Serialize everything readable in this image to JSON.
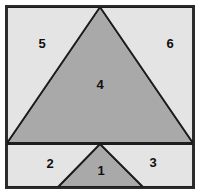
{
  "figure": {
    "type": "geometric-diagram",
    "canvas": {
      "width": 200,
      "height": 194
    },
    "colors": {
      "page_background": "#ffffff",
      "light_region_fill": "#e4e4e4",
      "dark_region_fill": "#a9a9a9",
      "outline_stroke": "#1c1c1c",
      "frame_stroke": "#2a2a2a",
      "label_text": "#101010"
    },
    "frame": {
      "x": 6,
      "y": 6,
      "width": 188,
      "height": 182,
      "stroke_width": 2
    },
    "divider": {
      "name": "horizontal-divider",
      "x1": 7,
      "y1": 143,
      "x2": 193,
      "y2": 143,
      "stroke_width": 2
    },
    "shapes": [
      {
        "id": "region-4",
        "label": "4",
        "shade": "dark",
        "points": "100,7 193,143 7,143",
        "label_x": 100,
        "label_y": 86
      },
      {
        "id": "region-5",
        "label": "5",
        "shade": "light",
        "points": "7,7 100,7 7,143",
        "label_x": 42,
        "label_y": 45
      },
      {
        "id": "region-6",
        "label": "6",
        "shade": "light",
        "points": "100,7 193,7 193,143",
        "label_x": 170,
        "label_y": 45
      },
      {
        "id": "region-1",
        "label": "1",
        "shade": "dark",
        "points": "100,144 143,187 58,187",
        "label_x": 101,
        "label_y": 172
      },
      {
        "id": "region-2",
        "label": "2",
        "shade": "light",
        "points": "7,144 100,144 58,187 7,187",
        "label_x": 50,
        "label_y": 165
      },
      {
        "id": "region-3",
        "label": "3",
        "shade": "light",
        "points": "100,144 193,144 193,187 143,187",
        "label_x": 153,
        "label_y": 164
      }
    ]
  }
}
